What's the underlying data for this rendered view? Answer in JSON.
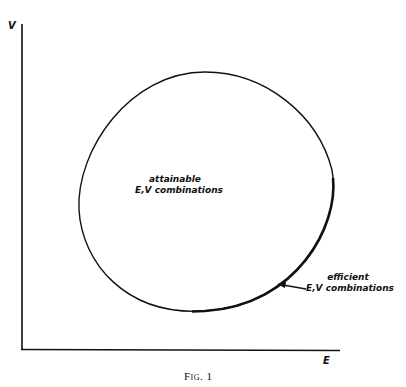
{
  "figure": {
    "caption": "Fig. 1",
    "y_axis_label": "V",
    "x_axis_label": "E",
    "region_label_line1": "attainable",
    "region_label_line2": "E,V combinations",
    "efficient_label_line1": "efficient",
    "efficient_label_line2": "E,V combinations"
  },
  "colors": {
    "ink": "#111111",
    "background": "#ffffff"
  }
}
